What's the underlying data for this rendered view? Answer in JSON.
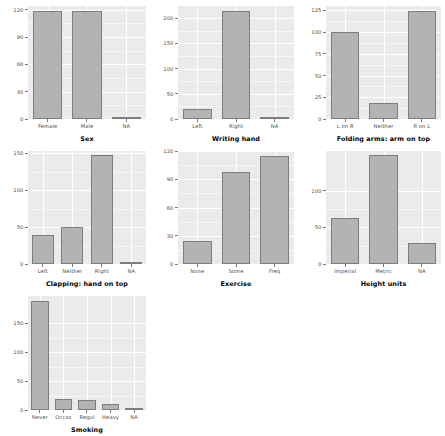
{
  "figure": {
    "background_color": "#ffffff",
    "panel_color": "#ebebeb",
    "bar_fill": "#b3b3b3",
    "bar_stroke": "#7d7d7d",
    "gridline_color": "#ffffff",
    "axis_text_color": "#4d4d4d",
    "title_text_color": "#000000"
  },
  "chart_data": [
    {
      "type": "bar",
      "title": "",
      "xlabel": "Sex",
      "ylabel": "",
      "categories": [
        "Female",
        "Male",
        "NA"
      ],
      "values": [
        118,
        118,
        1
      ],
      "ylim": [
        0,
        124
      ],
      "yticks": [
        0,
        30,
        60,
        90,
        120
      ],
      "ytick_labels": [
        "0",
        "30",
        "60",
        "90",
        "120"
      ],
      "grid": true,
      "legend": "none"
    },
    {
      "type": "bar",
      "title": "",
      "xlabel": "Writing hand",
      "ylabel": "",
      "categories": [
        "Left",
        "Right",
        "NA"
      ],
      "values": [
        20,
        215,
        2
      ],
      "ylim": [
        0,
        224
      ],
      "yticks": [
        0,
        50,
        100,
        150,
        200
      ],
      "ytick_labels": [
        "0",
        "50",
        "100",
        "150",
        "200"
      ],
      "grid": true,
      "legend": "none"
    },
    {
      "type": "bar",
      "title": "",
      "xlabel": "Folding arms: arm on top",
      "ylabel": "",
      "categories": [
        "L on R",
        "Neither",
        "R on L"
      ],
      "values": [
        100,
        18,
        124
      ],
      "ylim": [
        0,
        130
      ],
      "yticks": [
        0,
        25,
        50,
        75,
        100,
        125
      ],
      "ytick_labels": [
        "0",
        "25",
        "50",
        "75",
        "100",
        "125"
      ],
      "grid": true,
      "legend": "none"
    },
    {
      "type": "bar",
      "title": "",
      "xlabel": "Clapping: hand on top",
      "ylabel": "",
      "categories": [
        "Left",
        "Neither",
        "Right",
        "NA"
      ],
      "values": [
        39,
        50,
        147,
        1
      ],
      "ylim": [
        0,
        153
      ],
      "yticks": [
        0,
        50,
        100,
        150
      ],
      "ytick_labels": [
        "0",
        "50",
        "100",
        "150"
      ],
      "grid": true,
      "legend": "none"
    },
    {
      "type": "bar",
      "title": "",
      "xlabel": "Exercise",
      "ylabel": "",
      "categories": [
        "None",
        "Some",
        "Freq"
      ],
      "values": [
        24,
        98,
        115
      ],
      "ylim": [
        0,
        120
      ],
      "yticks": [
        0,
        30,
        60,
        90,
        120
      ],
      "ytick_labels": [
        "0",
        "30",
        "60",
        "90",
        "120"
      ],
      "grid": true,
      "legend": "none"
    },
    {
      "type": "bar",
      "title": "",
      "xlabel": "Height units",
      "ylabel": "",
      "categories": [
        "Imperial",
        "Metric",
        "NA"
      ],
      "values": [
        63,
        148,
        29
      ],
      "ylim": [
        0,
        154
      ],
      "yticks": [
        0,
        50,
        100
      ],
      "ytick_labels": [
        "0",
        "50",
        "100"
      ],
      "grid": true,
      "legend": "none"
    },
    {
      "type": "bar",
      "title": "",
      "xlabel": "Smoking",
      "ylabel": "",
      "categories": [
        "Never",
        "Occas",
        "Regul",
        "Heavy",
        "NA"
      ],
      "values": [
        189,
        19,
        17,
        11,
        1
      ],
      "ylim": [
        0,
        197
      ],
      "yticks": [
        0,
        50,
        100,
        150
      ],
      "ytick_labels": [
        "0",
        "50",
        "100",
        "150"
      ],
      "grid": true,
      "legend": "none"
    }
  ]
}
